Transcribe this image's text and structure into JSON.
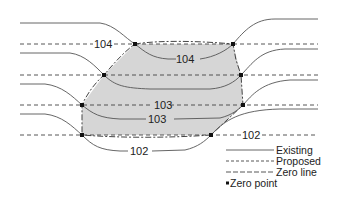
{
  "diagram": {
    "type": "contour cut-fill diagram",
    "colors": {
      "existing_line": "#555555",
      "proposed_line": "#444444",
      "zero_line": "#444444",
      "fill_area": "#d6d6d6",
      "zero_point": "#111111",
      "text": "#222222"
    },
    "proposed_contours": [
      {
        "label": "104",
        "y": 44
      },
      {
        "label": "",
        "y": 75
      },
      {
        "label": "103",
        "y": 105
      },
      {
        "label": "102",
        "y": 135
      }
    ],
    "existing_contour_labels": [
      {
        "label": "104"
      },
      {
        "label": "103"
      },
      {
        "label": "102"
      }
    ],
    "zero_points": [
      {
        "x": 135,
        "y": 44
      },
      {
        "x": 233,
        "y": 44
      },
      {
        "x": 104,
        "y": 75
      },
      {
        "x": 241,
        "y": 75
      },
      {
        "x": 82,
        "y": 105
      },
      {
        "x": 243,
        "y": 105
      },
      {
        "x": 82,
        "y": 135
      },
      {
        "x": 211,
        "y": 135
      }
    ]
  },
  "labels": {
    "proposed_104": "104",
    "proposed_103": "103",
    "proposed_102": "102",
    "existing_104": "104",
    "existing_103": "103",
    "existing_102": "102"
  },
  "legend": {
    "existing": "Existing",
    "proposed": "Proposed",
    "zero_line": "Zero line",
    "zero_point": "Zero point"
  }
}
